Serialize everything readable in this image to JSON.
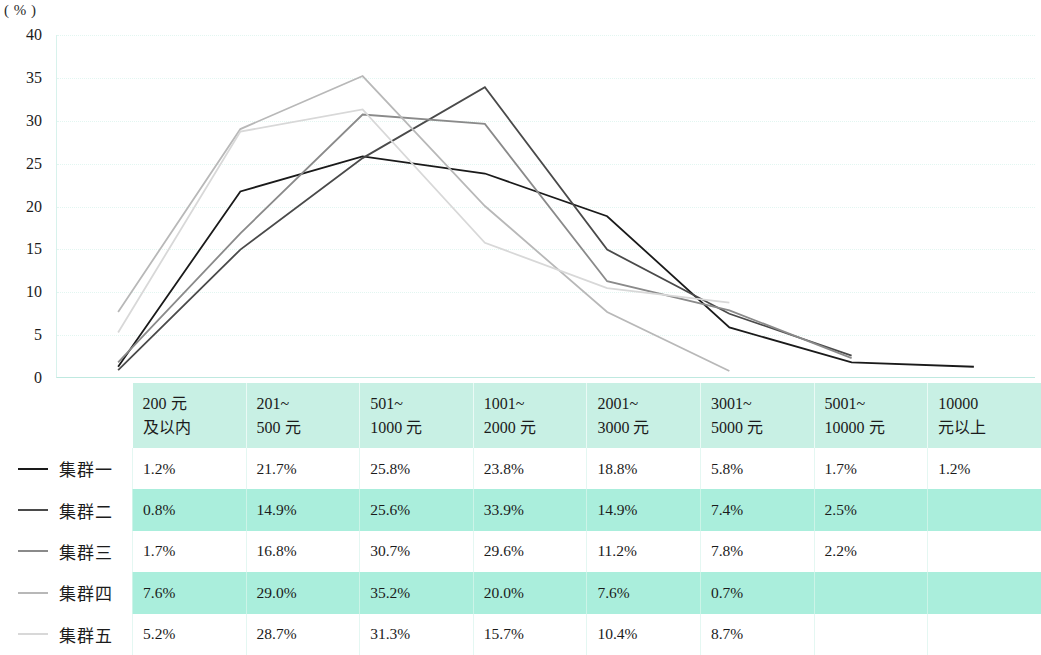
{
  "axis": {
    "unit_label": "( % )",
    "y_ticks": [
      "40",
      "35",
      "30",
      "25",
      "20",
      "15",
      "10",
      "5",
      "0"
    ]
  },
  "legend": {
    "items": [
      {
        "label": "集群一",
        "color": "#1a1a1a"
      },
      {
        "label": "集群二",
        "color": "#4a4a4a"
      },
      {
        "label": "集群三",
        "color": "#8a8a8a"
      },
      {
        "label": "集群四",
        "color": "#b8b8b8"
      },
      {
        "label": "集群五",
        "color": "#d8d8d8"
      }
    ]
  },
  "table": {
    "headers": [
      {
        "line1": "200 元",
        "line2": "及以内"
      },
      {
        "line1": "201~",
        "line2": "500 元"
      },
      {
        "line1": "501~",
        "line2": "1000 元"
      },
      {
        "line1": "1001~",
        "line2": "2000 元"
      },
      {
        "line1": "2001~",
        "line2": "3000 元"
      },
      {
        "line1": "3001~",
        "line2": "5000 元"
      },
      {
        "line1": "5001~",
        "line2": "10000 元"
      },
      {
        "line1": "10000",
        "line2": "元以上"
      }
    ],
    "rows": [
      {
        "name": "集群一",
        "cells": [
          "1.2%",
          "21.7%",
          "25.8%",
          "23.8%",
          "18.8%",
          "5.8%",
          "1.7%",
          "1.2%"
        ]
      },
      {
        "name": "集群二",
        "cells": [
          "0.8%",
          "14.9%",
          "25.6%",
          "33.9%",
          "14.9%",
          "7.4%",
          "2.5%",
          ""
        ]
      },
      {
        "name": "集群三",
        "cells": [
          "1.7%",
          "16.8%",
          "30.7%",
          "29.6%",
          "11.2%",
          "7.8%",
          "2.2%",
          ""
        ]
      },
      {
        "name": "集群四",
        "cells": [
          "7.6%",
          "29.0%",
          "35.2%",
          "20.0%",
          "7.6%",
          "0.7%",
          "",
          ""
        ]
      },
      {
        "name": "集群五",
        "cells": [
          "5.2%",
          "28.7%",
          "31.3%",
          "15.7%",
          "10.4%",
          "8.7%",
          "",
          ""
        ]
      }
    ]
  },
  "chart_data": {
    "type": "line",
    "title": "",
    "xlabel": "",
    "ylabel": "( % )",
    "ylim": [
      0,
      40
    ],
    "y_ticks": [
      0,
      5,
      10,
      15,
      20,
      25,
      30,
      35,
      40
    ],
    "grid": true,
    "legend_position": "left",
    "categories": [
      "200 元及以内",
      "201~500 元",
      "501~1000 元",
      "1001~2000 元",
      "2001~3000 元",
      "3001~5000 元",
      "5001~10000 元",
      "10000 元以上"
    ],
    "series": [
      {
        "name": "集群一",
        "color": "#1a1a1a",
        "values": [
          1.2,
          21.7,
          25.8,
          23.8,
          18.8,
          5.8,
          1.7,
          1.2
        ]
      },
      {
        "name": "集群二",
        "color": "#4a4a4a",
        "values": [
          0.8,
          14.9,
          25.6,
          33.9,
          14.9,
          7.4,
          2.5,
          null
        ]
      },
      {
        "name": "集群三",
        "color": "#8a8a8a",
        "values": [
          1.7,
          16.8,
          30.7,
          29.6,
          11.2,
          7.8,
          2.2,
          null
        ]
      },
      {
        "name": "集群四",
        "color": "#b8b8b8",
        "values": [
          7.6,
          29.0,
          35.2,
          20.0,
          7.6,
          0.7,
          null,
          null
        ]
      },
      {
        "name": "集群五",
        "color": "#d8d8d8",
        "values": [
          5.2,
          28.7,
          31.3,
          15.7,
          10.4,
          8.7,
          null,
          null
        ]
      }
    ]
  }
}
